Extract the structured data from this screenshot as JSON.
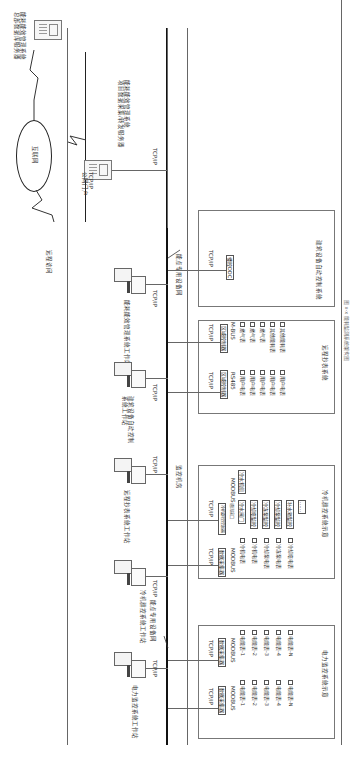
{
  "diagram": {
    "caption": "图 x-x 能耗监测系统架构图",
    "internet": {
      "cloud_label": "互联网",
      "remote_access_label": "远程访问",
      "central_server_label": [
        "能耗能效管理系统",
        "总部数据库服务器"
      ],
      "project_server_label": [
        "能耗能效管理系统",
        "项目数据采集/转发服务器"
      ],
      "gateway_label": [
        "TCP/IP",
        "公网门户"
      ],
      "project_server_link": "TCP/IP"
    },
    "networks": {
      "main_bus_label": "能点专用设备网",
      "secondary_bus_label": "能点专用设备网",
      "control_room_label": "监控机房"
    },
    "workstations": [
      {
        "label": "电力监控系统工作站",
        "link": "TCP/IP"
      },
      {
        "label": "冷机群控系统工作站",
        "link": "TCP/IP"
      },
      {
        "label": "远程抄表系统工作站",
        "link": "TCP/IP"
      },
      {
        "label": [
          "建筑设备自动控制",
          "系统工作站"
        ],
        "link": "TCP/IP"
      },
      {
        "label": "能耗能效管理系统工作站",
        "link": "TCP/IP"
      }
    ],
    "subsystems": {
      "power": {
        "title": "电力监控系统示意",
        "columns": [
          {
            "link": "TCP/IP",
            "collector": "数据采集器",
            "protocol": "MODBUS",
            "meters": [
              "电能表-1",
              "电能表-2",
              "电能表-3",
              "电能表-4",
              "电能表-N"
            ]
          },
          {
            "link": "TCP/IP",
            "collector": "数据采集器",
            "protocol": "MODBUS",
            "meters": [
              "电能表-1",
              "电能表-2",
              "电能表-3",
              "电能表-4",
              "电能表-N"
            ]
          }
        ]
      },
      "chiller": {
        "title": "冷机群控系统示意",
        "columns": [
          {
            "link": "TCP/IP",
            "collector": "数据采集器",
            "protocol": "MODBUS",
            "meters": [
              "冷机电表",
              "冷机电表",
              "冷却泵电表",
              "冷冻泵电表",
              "冷却塔电表"
            ]
          },
          {
            "link": "TCP/IP",
            "collector": "冷机群控控制器",
            "protocol": "MODBUS",
            "sub_label": "通讯接口",
            "devices": [
              "冷水阀门",
              "冷却塔监控",
              "冷冻泵监控",
              "冷却泵监控",
              "补水箱监控",
              "……"
            ],
            "extra": "冷水机组"
          }
        ]
      },
      "metering": {
        "title": "远程抄表系统",
        "columns": [
          {
            "link": "TCP/IP",
            "collector": "区域控制器",
            "protocol": "RS485",
            "meters": [
              "用户电表",
              "用户电表",
              "用户电表",
              "用户电表",
              "用户电表"
            ]
          },
          {
            "link": "TCP/IP",
            "collector": "区域控制器",
            "protocol": "M-BUS",
            "meters": [
              "燃气表",
              "燃气表",
              "燃气表",
              "其他能耗表",
              "其他能耗表"
            ]
          }
        ]
      },
      "bas": {
        "title": "建筑设备自动控制系统",
        "link": "TCP/IP",
        "controller": "楼控DDC"
      }
    }
  }
}
